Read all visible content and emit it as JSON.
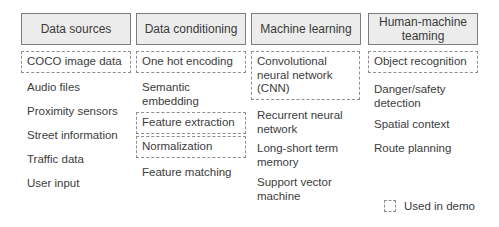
{
  "columns": [
    {
      "header": "Data sources",
      "items": [
        {
          "label": "COCO image data",
          "used_in_demo": true
        },
        {
          "label": "Audio files",
          "used_in_demo": false
        },
        {
          "label": "Proximity sensors",
          "used_in_demo": false
        },
        {
          "label": "Street information",
          "used_in_demo": false
        },
        {
          "label": "Traffic data",
          "used_in_demo": false
        },
        {
          "label": "User input",
          "used_in_demo": false
        }
      ]
    },
    {
      "header": "Data conditioning",
      "items": [
        {
          "label": "One hot encoding",
          "used_in_demo": true
        },
        {
          "label": "Semantic embedding",
          "used_in_demo": false
        },
        {
          "label": "Feature extraction",
          "used_in_demo": true
        },
        {
          "label": "Normalization",
          "used_in_demo": true
        },
        {
          "label": "Feature matching",
          "used_in_demo": false
        }
      ]
    },
    {
      "header": "Machine learning",
      "items": [
        {
          "label": "Convolutional neural network (CNN)",
          "used_in_demo": true
        },
        {
          "label": "Recurrent neural network",
          "used_in_demo": false
        },
        {
          "label": "Long-short term memory",
          "used_in_demo": false
        },
        {
          "label": "Support vector machine",
          "used_in_demo": false
        }
      ]
    },
    {
      "header": "Human-machine teaming",
      "items": [
        {
          "label": "Object recognition",
          "used_in_demo": true
        },
        {
          "label": "Danger/safety detection",
          "used_in_demo": false
        },
        {
          "label": "Spatial context",
          "used_in_demo": false
        },
        {
          "label": "Route planning",
          "used_in_demo": false
        }
      ]
    }
  ],
  "legend": {
    "icon": "dashed-box-icon",
    "label": "Used in demo"
  }
}
